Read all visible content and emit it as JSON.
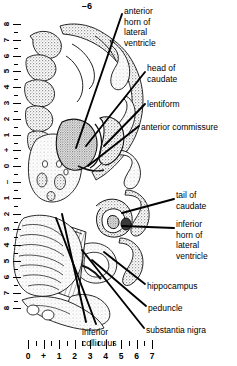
{
  "figure": {
    "section_id": "–6",
    "type": "brain-section-atlas-plate",
    "modality": "grayscale anatomical section drawing"
  },
  "labels": [
    {
      "name": "anterior-horn-of-lateral-ventricle",
      "text": "anterior\nhorn of\nlateral\nventricle"
    },
    {
      "name": "head-of-caudate",
      "text": "head of\ncaudate"
    },
    {
      "name": "lentiform",
      "text": "lentiform"
    },
    {
      "name": "anterior-commissure",
      "text": "anterior commissure"
    },
    {
      "name": "tail-of-caudate",
      "text": "tail of\ncaudate"
    },
    {
      "name": "inferior-horn-of-lateral-ventricle",
      "text": "inferior\nhorn of\nlateral\nventricle"
    },
    {
      "name": "hippocampus",
      "text": "hippocampus"
    },
    {
      "name": "peduncle",
      "text": "peduncle"
    },
    {
      "name": "substantia-nigra",
      "text": "substantia nigra"
    },
    {
      "name": "inferior-colliculus",
      "text": "inferior\ncolliculus"
    }
  ],
  "vertical_scale": {
    "name": "vertical-scale-cm",
    "labels": [
      "8",
      "7",
      "6",
      "5",
      "4",
      "3",
      "2",
      "1",
      "+",
      "0",
      "–",
      "1",
      "2",
      "3",
      "4",
      "5",
      "6",
      "7",
      "8"
    ]
  },
  "horizontal_ruler": {
    "name": "horizontal-ruler-cm",
    "labels": [
      "0",
      "+",
      "1",
      "2",
      "3",
      "4",
      "5",
      "6",
      "7"
    ]
  },
  "colors": {
    "ink": "#000000",
    "paper": "#ffffff",
    "gray_matter": "#9a9a9a",
    "gray_matter_light": "#c9c9c9",
    "white_matter": "#f2f2f2",
    "stipple": "#6e6e6e"
  }
}
